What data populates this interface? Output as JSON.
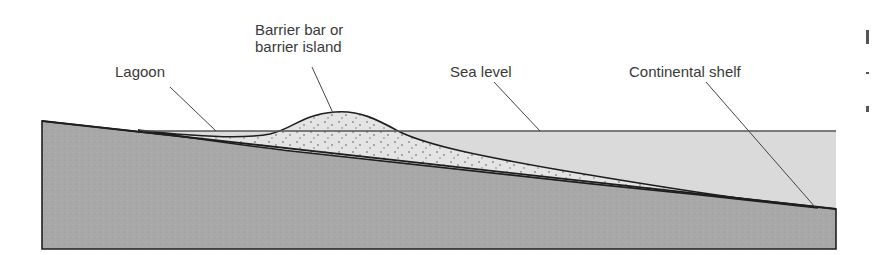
{
  "diagram": {
    "labels": {
      "lagoon": "Lagoon",
      "barrier_line1": "Barrier bar or",
      "barrier_line2": "barrier island",
      "sea_level": "Sea level",
      "continental_shelf": "Continental shelf"
    },
    "colors": {
      "bedrock": "#a9a9a9",
      "water": "#dcdcdc",
      "sediment": "#e6e6e6",
      "outline": "#1e1e1e",
      "leader": "#444444",
      "text": "#3a3a3a"
    }
  }
}
